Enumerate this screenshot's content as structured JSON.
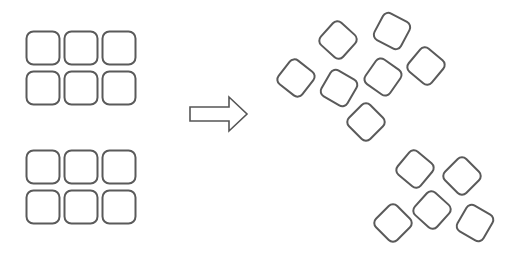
{
  "diagram": {
    "colors": {
      "stroke": "#5a5a5a",
      "background": "#ffffff"
    },
    "left_groups": [
      {
        "name": "top-grid",
        "origin": [
          26,
          31
        ],
        "rows": 2,
        "cols": 3
      },
      {
        "name": "bottom-grid",
        "origin": [
          26,
          150
        ],
        "rows": 2,
        "cols": 3
      }
    ],
    "tile_size": 33,
    "tile_gap": 5,
    "arrow": {
      "direction": "right",
      "x": 190,
      "y": 112
    },
    "right_upper_cluster": [
      {
        "cx": 338,
        "cy": 40,
        "rot": 42
      },
      {
        "cx": 392,
        "cy": 31,
        "rot": 28
      },
      {
        "cx": 296,
        "cy": 78,
        "rot": 38
      },
      {
        "cx": 339,
        "cy": 88,
        "rot": 30
      },
      {
        "cx": 383,
        "cy": 77,
        "rot": 35
      },
      {
        "cx": 426,
        "cy": 66,
        "rot": 40
      },
      {
        "cx": 366,
        "cy": 122,
        "rot": 45
      }
    ],
    "right_lower_cluster": [
      {
        "cx": 415,
        "cy": 169,
        "rot": 40
      },
      {
        "cx": 462,
        "cy": 176,
        "rot": 45
      },
      {
        "cx": 432,
        "cy": 210,
        "rot": 42
      },
      {
        "cx": 393,
        "cy": 223,
        "rot": 45
      },
      {
        "cx": 475,
        "cy": 223,
        "rot": 30
      }
    ]
  }
}
